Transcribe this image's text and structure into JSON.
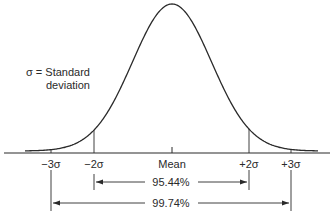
{
  "diagram": {
    "legend": {
      "line1": "σ = Standard",
      "line2": "deviation"
    },
    "axis_labels": [
      {
        "id": "minus3",
        "text": "−3σ",
        "x": 51
      },
      {
        "id": "minus2",
        "text": "−2σ",
        "x": 94
      },
      {
        "id": "mean",
        "text": "Mean",
        "x": 172
      },
      {
        "id": "plus2",
        "text": "+2σ",
        "x": 249
      },
      {
        "id": "plus3",
        "text": "+3σ",
        "x": 291
      }
    ],
    "ranges": [
      {
        "id": "two_sigma",
        "text": "95.44%",
        "from": "−2σ",
        "to": "+2σ"
      },
      {
        "id": "three_sigma",
        "text": "99.74%",
        "from": "−3σ",
        "to": "+3σ"
      }
    ],
    "colors": {
      "line": "#2a2a2a",
      "background": "#ffffff"
    }
  }
}
